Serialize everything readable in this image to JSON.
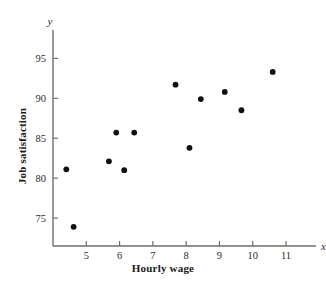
{
  "chart_data": {
    "type": "scatter",
    "title": "",
    "xlabel": "Hourly wage",
    "ylabel": "Job satisfaction",
    "x_var_label": "x",
    "y_var_label": "y",
    "xlim": [
      4.0,
      11.6
    ],
    "ylim": [
      71.5,
      96.8
    ],
    "xticks": [
      5,
      6,
      7,
      8,
      9,
      10,
      11
    ],
    "xtick_labels": [
      "5",
      "6",
      "7",
      "8",
      "9",
      "10",
      "11"
    ],
    "yticks": [
      75,
      80,
      85,
      90,
      95
    ],
    "ytick_labels": [
      "75",
      "80",
      "85",
      "90",
      "95"
    ],
    "grid": false,
    "legend": null,
    "marker_color": "#111111",
    "axis_color": "#6e6e6e",
    "points": [
      {
        "x": 4.4,
        "y": 81.1
      },
      {
        "x": 4.62,
        "y": 73.9
      },
      {
        "x": 5.68,
        "y": 82.1
      },
      {
        "x": 5.9,
        "y": 85.7
      },
      {
        "x": 6.14,
        "y": 81.0
      },
      {
        "x": 6.44,
        "y": 85.7
      },
      {
        "x": 7.68,
        "y": 91.7
      },
      {
        "x": 8.1,
        "y": 83.8
      },
      {
        "x": 8.44,
        "y": 89.9
      },
      {
        "x": 9.16,
        "y": 90.8
      },
      {
        "x": 9.66,
        "y": 88.5
      },
      {
        "x": 10.6,
        "y": 93.3
      }
    ]
  },
  "caption": {
    "text": ""
  }
}
